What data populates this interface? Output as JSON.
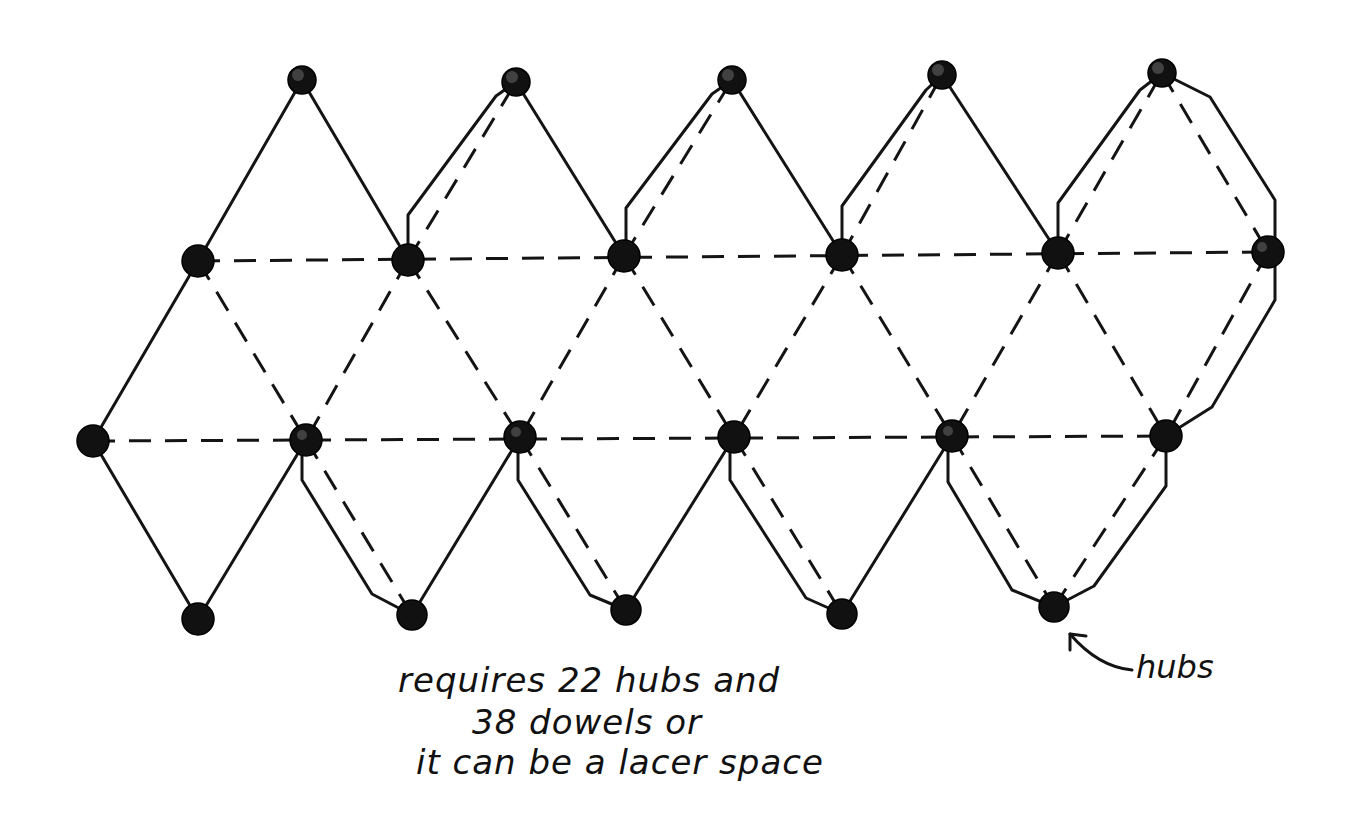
{
  "diagram": {
    "legend": {
      "solid_line": "solid edge (dowel on outer boundary / lacing path)",
      "dashed_line": "dashed edge (fold / internal dowel)",
      "filled_circle": "hub"
    },
    "colors": {
      "ink": "#141414",
      "hub_fill": "#111111",
      "background": "#ffffff"
    },
    "hubs": {
      "count": 22,
      "rows": [
        {
          "name": "top",
          "points": [
            [
              302,
              80
            ],
            [
              516,
              82
            ],
            [
              732,
              80
            ],
            [
              942,
              75
            ],
            [
              1162,
              73
            ]
          ]
        },
        {
          "name": "upper-middle",
          "points": [
            [
              198,
              261
            ],
            [
              408,
              260
            ],
            [
              624,
              256
            ],
            [
              842,
              255
            ],
            [
              1058,
              253
            ],
            [
              1268,
              252
            ]
          ]
        },
        {
          "name": "lower-middle",
          "points": [
            [
              93,
              441
            ],
            [
              306,
              440
            ],
            [
              520,
              437
            ],
            [
              734,
              437
            ],
            [
              952,
              436
            ],
            [
              1166,
              436
            ]
          ]
        },
        {
          "name": "bottom",
          "points": [
            [
              198,
              619
            ],
            [
              412,
              615
            ],
            [
              626,
              610
            ],
            [
              842,
              614
            ],
            [
              1054,
              607
            ]
          ]
        }
      ]
    }
  },
  "annotations": {
    "note_lines": [
      "requires 22 hubs and",
      "38 dowels or",
      "it can be a lacer space"
    ],
    "hub_callout": "hubs"
  }
}
